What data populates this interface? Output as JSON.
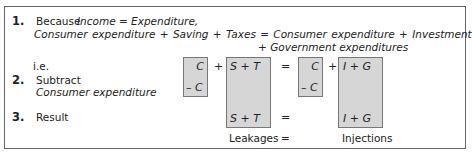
{
  "step1": {
    "number": "1.",
    "line1_prefix": "Because",
    "line1_eq": "Income = Expenditure,",
    "line2": "Consumer expenditure + Saving + Taxes = Consumer expenditure + Investment",
    "line3": "+ Government expenditures"
  },
  "ie_label": "i.e.",
  "step2": {
    "number": "2.",
    "label": "Subtract",
    "sublabel": "Consumer expenditure"
  },
  "step3": {
    "number": "3.",
    "label": "Result"
  },
  "equation": {
    "c1_top": "C",
    "c1_bottom": "– C",
    "plus1": "+",
    "st_top": "S  +  T",
    "st_bottom": "S  +  T",
    "eq": "=",
    "c2_top": "C",
    "c2_bottom": "– C",
    "plus2": "+",
    "ig_top": "I  +  G",
    "ig_bottom": "I  +  G",
    "eq_result": "=",
    "eq_labels": "="
  },
  "labels": {
    "leakages": "Leakages",
    "injections": "Injections"
  },
  "colors": {
    "box_fill": "#d6d6d6",
    "border": "#666666"
  }
}
